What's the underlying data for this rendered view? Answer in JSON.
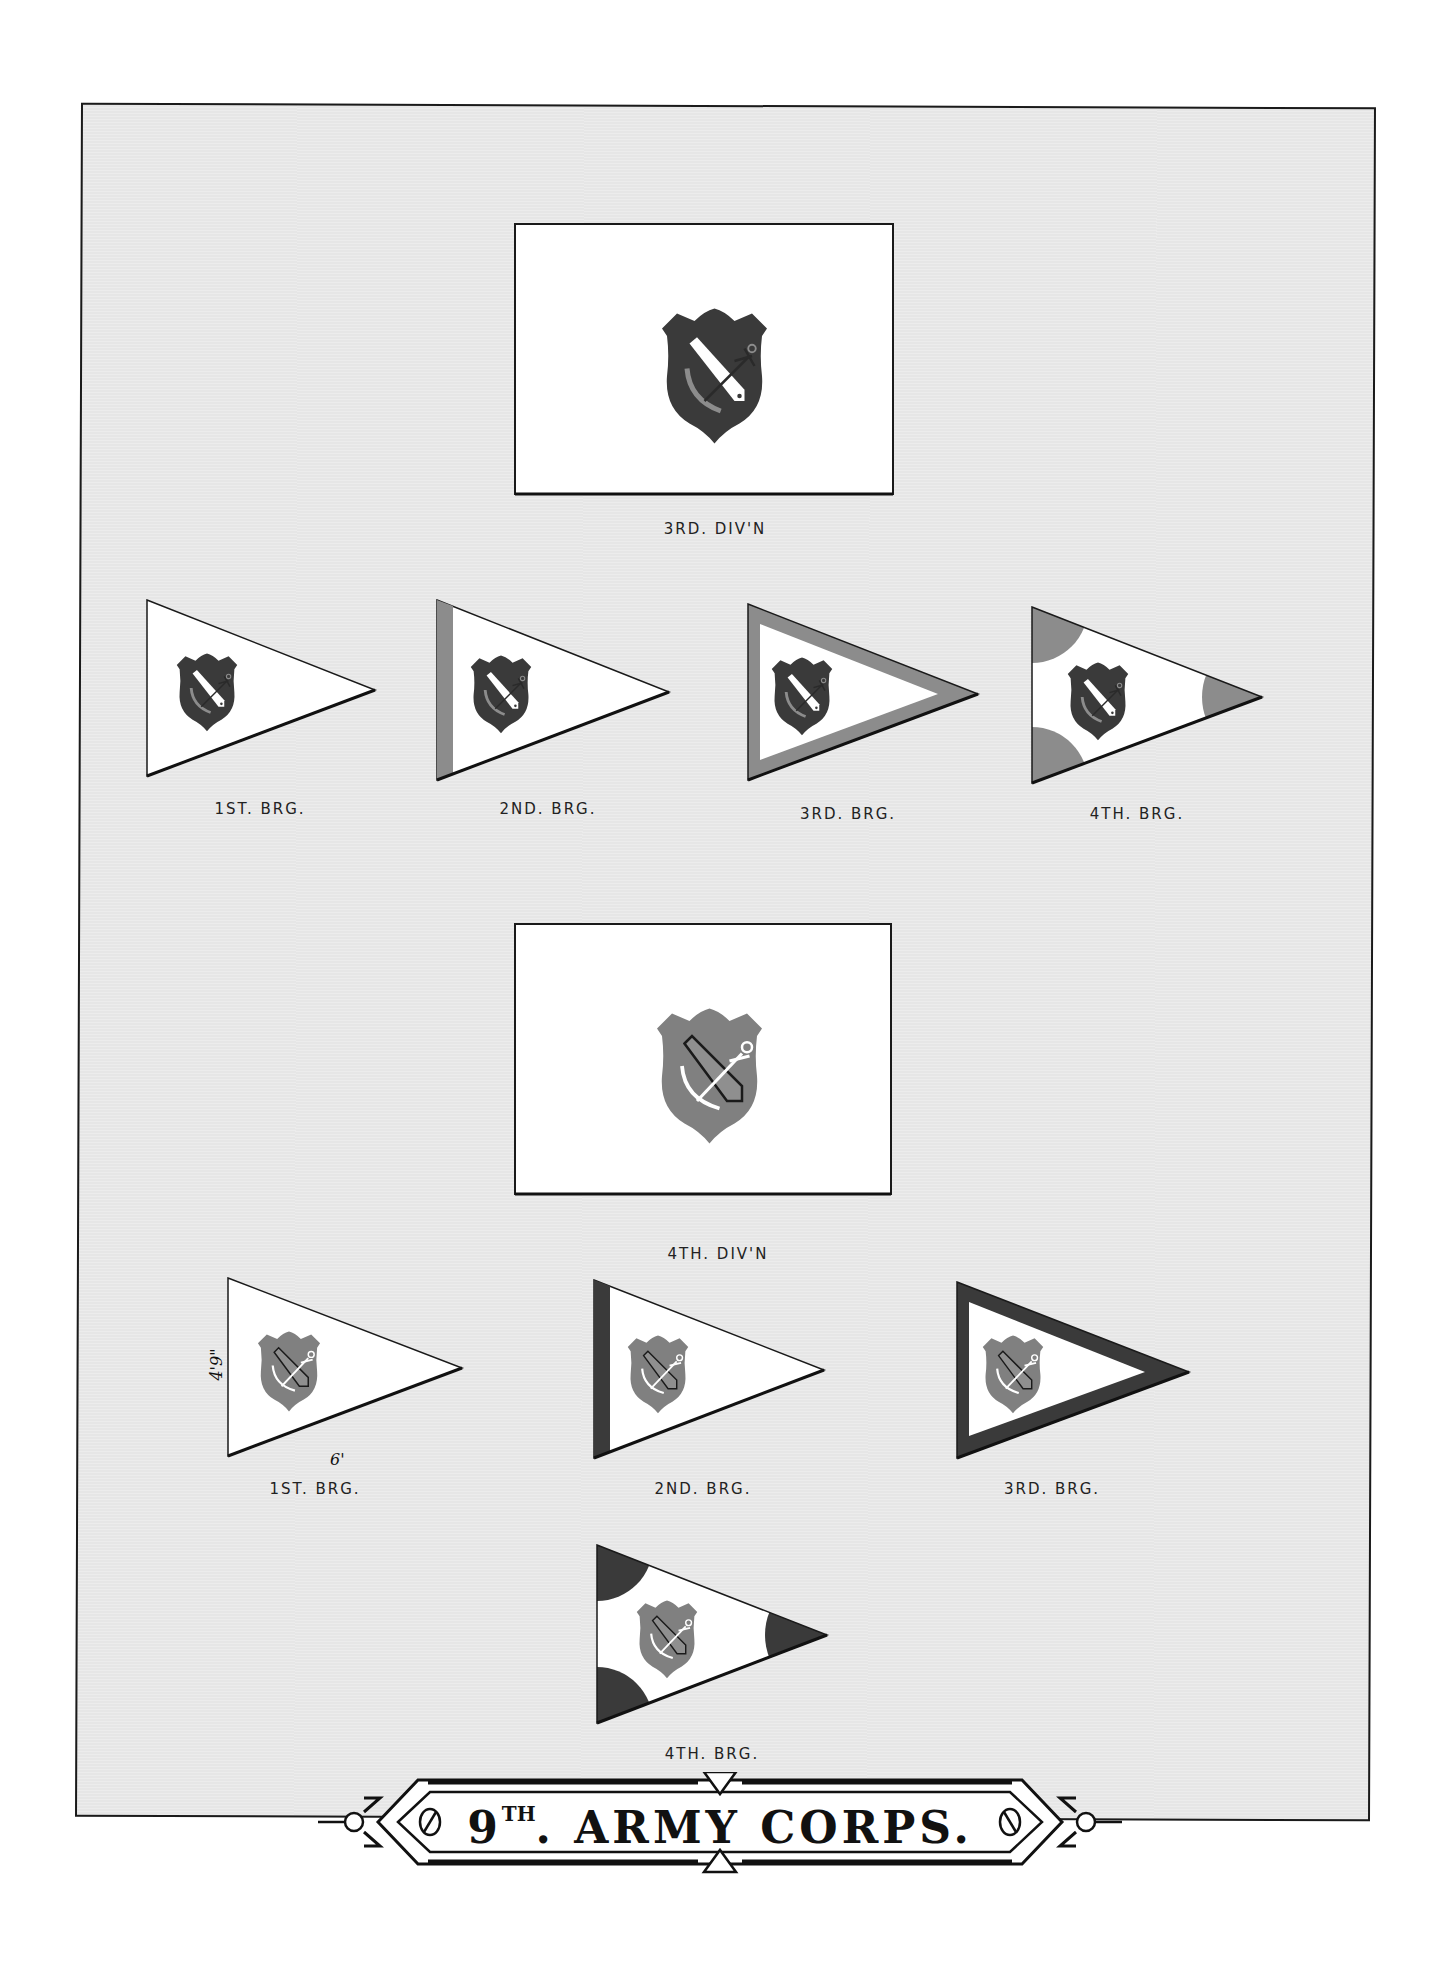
{
  "plate": {
    "title": {
      "number": "9",
      "ordinal": "TH",
      "dot": ".",
      "rest": " ARMY CORPS."
    },
    "colors": {
      "background": "#e6e6e6",
      "flag_field": "#ffffff",
      "border": "#1a1a1a",
      "third_div_shield": "#3a3a3a",
      "third_div_accent": "#8c8c8c",
      "fourth_div_shield": "#808080",
      "fourth_div_accent": "#3a3a3a"
    }
  },
  "divisions": [
    {
      "label": "3RD. DIV'N",
      "flag": {
        "shape": "rectangle",
        "emblem": "shield-cannon-anchor",
        "shield_color": "#3a3a3a",
        "cannon_color": "#ffffff"
      },
      "brigades": [
        {
          "label": "1ST. BRG.",
          "pattern": "plain"
        },
        {
          "label": "2ND. BRG.",
          "pattern": "hoist-stripe",
          "accent": "#8c8c8c"
        },
        {
          "label": "3RD. BRG.",
          "pattern": "border",
          "accent": "#8c8c8c"
        },
        {
          "label": "4TH. BRG.",
          "pattern": "corner-discs",
          "accent": "#8c8c8c"
        }
      ]
    },
    {
      "label": "4TH. DIV'N",
      "flag": {
        "shape": "rectangle",
        "emblem": "shield-cannon-anchor",
        "shield_color": "#808080",
        "cannon_color": "#8c8c8c"
      },
      "brigades": [
        {
          "label": "1ST. BRG.",
          "pattern": "plain",
          "dimensions": {
            "height": "4'9\"",
            "length": "6'"
          }
        },
        {
          "label": "2ND. BRG.",
          "pattern": "hoist-stripe",
          "accent": "#3a3a3a"
        },
        {
          "label": "3RD. BRG.",
          "pattern": "border",
          "accent": "#3a3a3a"
        },
        {
          "label": "4TH. BRG.",
          "pattern": "corner-discs",
          "accent": "#3a3a3a"
        }
      ]
    }
  ]
}
